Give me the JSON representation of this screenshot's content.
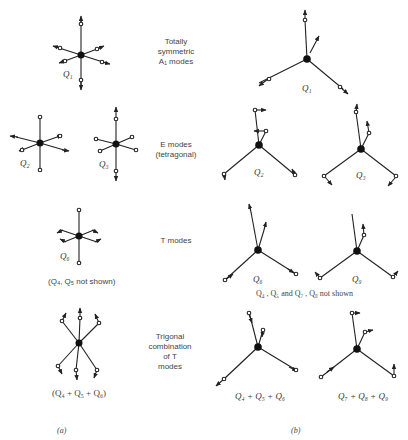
{
  "figure": {
    "panels": {
      "a": "(a)",
      "b": "(b)"
    },
    "rows": [
      {
        "description_lines": [
          "Totally",
          "symmetric",
          "A₁ modes"
        ],
        "a_labels": [
          "Q₁"
        ],
        "a_caption": "",
        "b_labels": [
          "Q₁"
        ],
        "b_caption": ""
      },
      {
        "description_lines": [
          "E modes",
          "(tetragonal)"
        ],
        "a_labels": [
          "Q₂",
          "Q₃"
        ],
        "a_caption": "",
        "b_labels": [
          "Q₂",
          "Q₃"
        ],
        "b_caption": ""
      },
      {
        "description_lines": [
          "T modes"
        ],
        "a_labels": [
          "Q₆"
        ],
        "a_caption": "(Q₄, Q₅ not shown)",
        "b_labels": [
          "Q₆",
          "Q₉"
        ],
        "b_caption": "Q₄ , Q₅ and Q₇ , Q₈ not shown"
      },
      {
        "description_lines": [
          "Trigonal",
          "combination",
          "of T",
          "modes"
        ],
        "a_labels": [],
        "a_caption": "(Q₄ + Q₅ + Q₆)",
        "b_labels": [
          "Q₄ + Q₅ + Q₆",
          "Q₇ + Q₈ + Q₉"
        ],
        "b_caption": ""
      }
    ]
  },
  "colors": {
    "ink": "#222222",
    "background": "#ffffff"
  }
}
